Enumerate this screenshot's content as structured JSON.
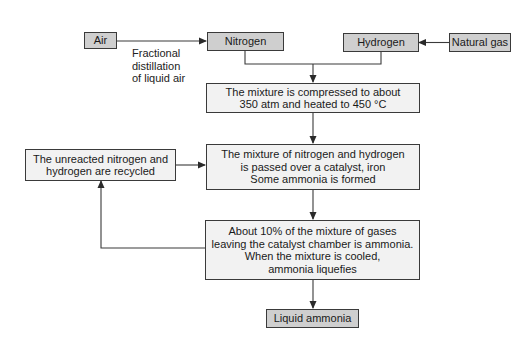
{
  "diagram": {
    "nodes": {
      "air": {
        "label": "Air"
      },
      "nitrogen": {
        "label": "Nitrogen"
      },
      "hydrogen": {
        "label": "Hydrogen"
      },
      "natural_gas": {
        "label": "Natural gas"
      },
      "compress": {
        "lines": [
          "The mixture is compressed to about",
          "350 atm and heated to 450 °C"
        ]
      },
      "catalyst": {
        "lines": [
          "The mixture of nitrogen and hydrogen",
          "is passed over a catalyst, iron",
          "Some ammonia is formed"
        ]
      },
      "recycle": {
        "lines": [
          "The unreacted nitrogen and",
          "hydrogen are recycled"
        ]
      },
      "cooling": {
        "lines": [
          "About 10% of the mixture of gases",
          "leaving the catalyst chamber is ammonia.",
          "When the mixture is cooled,",
          "ammonia liquefies"
        ]
      },
      "liquid_ammonia": {
        "label": "Liquid ammonia"
      }
    },
    "edge_labels": {
      "air_to_nitrogen": [
        "Fractional",
        "distillation",
        "of liquid air"
      ]
    },
    "edges": [
      {
        "from": "air",
        "to": "nitrogen",
        "label": "Fractional distillation of liquid air"
      },
      {
        "from": "natural_gas",
        "to": "hydrogen"
      },
      {
        "from": "nitrogen",
        "to": "compress"
      },
      {
        "from": "hydrogen",
        "to": "compress"
      },
      {
        "from": "compress",
        "to": "catalyst"
      },
      {
        "from": "recycle",
        "to": "catalyst"
      },
      {
        "from": "catalyst",
        "to": "cooling"
      },
      {
        "from": "cooling",
        "to": "recycle"
      },
      {
        "from": "cooling",
        "to": "liquid_ammonia"
      }
    ],
    "colors": {
      "terminal_fill": "#cfcfcf",
      "process_fill": "#f2f2f2",
      "stroke": "#3a3a3a"
    }
  }
}
